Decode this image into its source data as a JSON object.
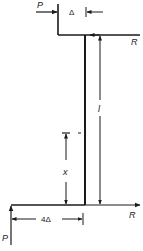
{
  "diagram": {
    "type": "structural-frame",
    "labels": {
      "load_top": "P",
      "load_bottom": "P",
      "reaction_top": "R",
      "reaction_bottom": "R",
      "offset_top": "Δ",
      "offset_bottom": "4Δ",
      "column_length": "l",
      "position": "x"
    },
    "colors": {
      "line": "#1a1a1a",
      "background": "#ffffff"
    }
  }
}
